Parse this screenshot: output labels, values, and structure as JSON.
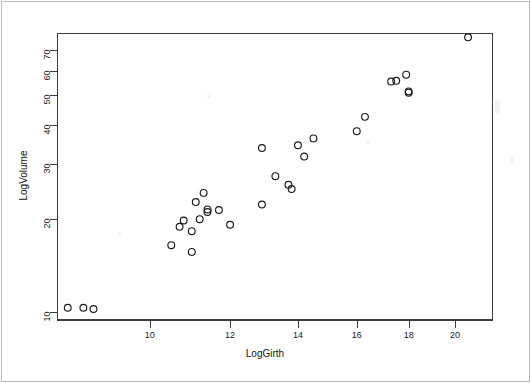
{
  "chart_data": {
    "type": "scatter",
    "title": "",
    "xlabel": "LogGirth",
    "ylabel": "LogVolume",
    "xscale": "log",
    "yscale": "log",
    "xlim": [
      8.1,
      21.8
    ],
    "ylim": [
      9.4,
      79.5
    ],
    "grid": false,
    "legend": null,
    "marker": "open-circle",
    "marker_color": "#1a1a1a",
    "x_ticks": [
      10,
      12,
      14,
      16,
      18,
      20
    ],
    "y_ticks": [
      10,
      20,
      30,
      40,
      50,
      60,
      70
    ],
    "x_tick_labels": [
      "10",
      "12",
      "14",
      "16",
      "18",
      "20"
    ],
    "y_tick_labels": [
      "10",
      "20",
      "30",
      "40",
      "50",
      "60",
      "70"
    ],
    "n_points": 31,
    "x": [
      8.3,
      8.6,
      8.8,
      10.5,
      10.7,
      10.8,
      11.0,
      11.0,
      11.1,
      11.2,
      11.3,
      11.4,
      11.4,
      11.7,
      12.0,
      12.9,
      12.9,
      13.3,
      13.7,
      13.8,
      14.0,
      14.2,
      14.5,
      16.0,
      16.3,
      17.3,
      17.5,
      17.9,
      18.0,
      18.0,
      20.6
    ],
    "y": [
      10.3,
      10.3,
      10.2,
      16.4,
      18.8,
      19.7,
      15.6,
      18.2,
      22.6,
      19.9,
      24.2,
      21.0,
      21.4,
      21.3,
      19.1,
      22.2,
      33.8,
      27.4,
      25.7,
      24.9,
      34.5,
      31.7,
      36.3,
      38.3,
      42.6,
      55.4,
      55.7,
      58.3,
      51.5,
      51.0,
      77.0
    ],
    "points": [
      {
        "x": 8.3,
        "y": 10.3
      },
      {
        "x": 8.6,
        "y": 10.3
      },
      {
        "x": 8.8,
        "y": 10.2
      },
      {
        "x": 10.5,
        "y": 16.4
      },
      {
        "x": 10.7,
        "y": 18.8
      },
      {
        "x": 10.8,
        "y": 19.7
      },
      {
        "x": 11.0,
        "y": 15.6
      },
      {
        "x": 11.0,
        "y": 18.2
      },
      {
        "x": 11.1,
        "y": 22.6
      },
      {
        "x": 11.2,
        "y": 19.9
      },
      {
        "x": 11.3,
        "y": 24.2
      },
      {
        "x": 11.4,
        "y": 21.0
      },
      {
        "x": 11.4,
        "y": 21.4
      },
      {
        "x": 11.7,
        "y": 21.3
      },
      {
        "x": 12.0,
        "y": 19.1
      },
      {
        "x": 12.9,
        "y": 22.2
      },
      {
        "x": 12.9,
        "y": 33.8
      },
      {
        "x": 13.3,
        "y": 27.4
      },
      {
        "x": 13.7,
        "y": 25.7
      },
      {
        "x": 13.8,
        "y": 24.9
      },
      {
        "x": 14.0,
        "y": 34.5
      },
      {
        "x": 14.2,
        "y": 31.7
      },
      {
        "x": 14.5,
        "y": 36.3
      },
      {
        "x": 16.0,
        "y": 38.3
      },
      {
        "x": 16.3,
        "y": 42.6
      },
      {
        "x": 17.3,
        "y": 55.4
      },
      {
        "x": 17.5,
        "y": 55.7
      },
      {
        "x": 17.9,
        "y": 58.3
      },
      {
        "x": 18.0,
        "y": 51.5
      },
      {
        "x": 18.0,
        "y": 51.0
      },
      {
        "x": 20.6,
        "y": 77.0
      }
    ]
  }
}
